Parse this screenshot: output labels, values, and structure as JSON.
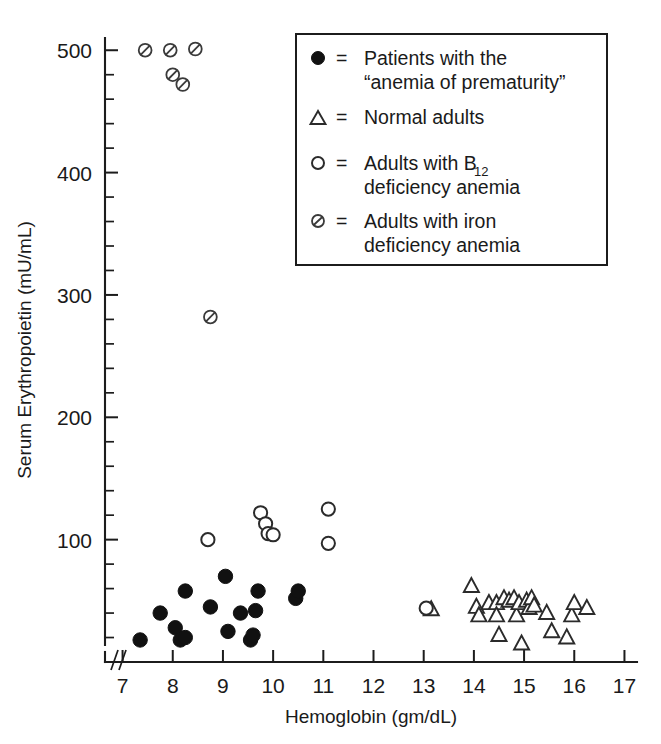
{
  "chart_data": {
    "type": "scatter",
    "title": "",
    "xlabel": "Hemoglobin (gm/dL)",
    "ylabel": "Serum Erythropoietin (mU/mL)",
    "xlim": [
      6.65,
      17.25
    ],
    "ylim": [
      0,
      510
    ],
    "x_ticks": [
      7,
      8,
      9,
      10,
      11,
      12,
      13,
      14,
      15,
      16,
      17
    ],
    "x_tick_labels": [
      "7",
      "8",
      "9",
      "10",
      "11",
      "12",
      "13",
      "14",
      "15",
      "16",
      "17"
    ],
    "y_ticks": [
      100,
      200,
      300,
      400,
      500
    ],
    "y_tick_labels": [
      "100",
      "200",
      "300",
      "400",
      "500"
    ],
    "y_minor_step": 20,
    "axis_break": true,
    "grid": false,
    "legend_position": "top-right",
    "series": [
      {
        "name": "Patients with the \"anemia of prematurity\"",
        "marker": "filled-circle",
        "points": [
          [
            7.35,
            18
          ],
          [
            7.75,
            40
          ],
          [
            8.05,
            28
          ],
          [
            8.15,
            18
          ],
          [
            8.25,
            20
          ],
          [
            8.25,
            58
          ],
          [
            8.75,
            45
          ],
          [
            9.05,
            70
          ],
          [
            9.1,
            25
          ],
          [
            9.35,
            40
          ],
          [
            9.55,
            18
          ],
          [
            9.6,
            22
          ],
          [
            9.65,
            42
          ],
          [
            9.7,
            58
          ],
          [
            10.45,
            52
          ],
          [
            10.5,
            58
          ]
        ]
      },
      {
        "name": "Normal adults",
        "marker": "open-triangle",
        "points": [
          [
            13.15,
            43
          ],
          [
            13.95,
            62
          ],
          [
            14.05,
            45
          ],
          [
            14.1,
            38
          ],
          [
            14.3,
            48
          ],
          [
            14.45,
            48
          ],
          [
            14.45,
            38
          ],
          [
            14.5,
            22
          ],
          [
            14.6,
            52
          ],
          [
            14.7,
            50
          ],
          [
            14.8,
            52
          ],
          [
            14.85,
            38
          ],
          [
            14.9,
            48
          ],
          [
            14.95,
            15
          ],
          [
            15.05,
            50
          ],
          [
            15.1,
            44
          ],
          [
            15.15,
            52
          ],
          [
            15.2,
            46
          ],
          [
            15.45,
            40
          ],
          [
            15.55,
            25
          ],
          [
            15.85,
            20
          ],
          [
            15.95,
            38
          ],
          [
            16.0,
            48
          ],
          [
            16.25,
            44
          ]
        ]
      },
      {
        "name": "Adults with B12 deficiency anemia",
        "marker": "open-circle",
        "points": [
          [
            8.7,
            100
          ],
          [
            9.75,
            122
          ],
          [
            9.85,
            113
          ],
          [
            9.9,
            105
          ],
          [
            10.0,
            104
          ],
          [
            11.1,
            125
          ],
          [
            11.1,
            97
          ],
          [
            13.05,
            44
          ]
        ]
      },
      {
        "name": "Adults with iron deficiency anemia",
        "marker": "slashed-circle",
        "points": [
          [
            7.45,
            500
          ],
          [
            7.95,
            500
          ],
          [
            8.45,
            501
          ],
          [
            8.0,
            480
          ],
          [
            8.2,
            472
          ],
          [
            8.75,
            282
          ]
        ]
      }
    ]
  },
  "legend": {
    "entries": [
      {
        "marker": "filled-circle",
        "equals": "=",
        "line1": "Patients with the",
        "line2": "“anemia of prematurity”"
      },
      {
        "marker": "open-triangle",
        "equals": "=",
        "line1": "Normal adults",
        "line2": ""
      },
      {
        "marker": "open-circle",
        "equals": "=",
        "line1": "Adults with B",
        "subscript": "12",
        "line2": "deficiency anemia"
      },
      {
        "marker": "slashed-circle",
        "equals": "=",
        "line1": "Adults with iron",
        "line2": "deficiency anemia"
      }
    ]
  },
  "colors": {
    "ink": "#1a1a1a",
    "marker_fill": "#111111",
    "marker_stroke": "#2b2b2b",
    "background": "#ffffff"
  }
}
